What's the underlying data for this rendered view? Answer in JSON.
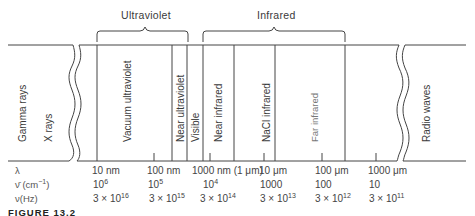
{
  "diagram": {
    "title_groups": [
      {
        "label": "Ultraviolet"
      },
      {
        "label": "Infrared"
      }
    ],
    "regions": [
      {
        "label": "Gamma rays"
      },
      {
        "label": "X rays"
      },
      {
        "label": "Vacuum ultraviolet"
      },
      {
        "label": "Near ultraviolet"
      },
      {
        "label": "Visible"
      },
      {
        "label": "Near infrared"
      },
      {
        "label": "NaCl infrared"
      },
      {
        "label": "Far infrared"
      },
      {
        "label": "Radio waves"
      }
    ],
    "row_labels": {
      "wavelength": "λ",
      "wavenumber": "ν̄ (cm",
      "wavenumber_exp": "−1",
      "wavenumber_close": ")",
      "frequency": "ν(Hz)"
    },
    "wavelength_ticks": [
      "10 nm",
      "100 nm",
      "1000 nm (1 μm)",
      "10 μm",
      "100 μm",
      "1000 μm"
    ],
    "wavenumber_ticks": [
      {
        "base": "10",
        "exp": "6"
      },
      {
        "base": "10",
        "exp": "5"
      },
      {
        "base": "10",
        "exp": "4"
      },
      {
        "base": "1000",
        "exp": ""
      },
      {
        "base": "100",
        "exp": ""
      },
      {
        "base": "10",
        "exp": ""
      }
    ],
    "frequency_ticks": [
      {
        "base": "3 × 10",
        "exp": "16"
      },
      {
        "base": "3 × 10",
        "exp": "15"
      },
      {
        "base": "3 × 10",
        "exp": "14"
      },
      {
        "base": "3 × 10",
        "exp": "13"
      },
      {
        "base": "3 × 10",
        "exp": "12"
      },
      {
        "base": "3 × 10",
        "exp": "11"
      }
    ],
    "caption": "FIGURE 13.2"
  }
}
